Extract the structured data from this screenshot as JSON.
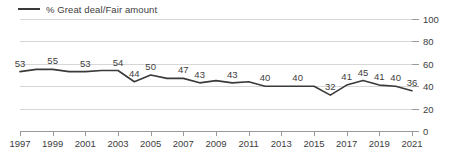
{
  "legend": {
    "label": "% Great deal/Fair amount",
    "line_color": "#3a3a3a",
    "icon": "line-swatch-icon"
  },
  "axes": {
    "y_ticks": [
      0,
      20,
      40,
      60,
      80,
      100
    ],
    "y_min": 0,
    "y_max": 100,
    "x_ticks": [
      1997,
      1999,
      2001,
      2003,
      2005,
      2007,
      2009,
      2011,
      2013,
      2015,
      2017,
      2019,
      2021
    ],
    "x_min": 1997,
    "x_max": 2021,
    "grid": true
  },
  "chart_data": {
    "type": "line",
    "title": "",
    "subtitle": "",
    "xlabel": "",
    "ylabel": "",
    "ylim": [
      0,
      100
    ],
    "xlim": [
      1997,
      2021
    ],
    "grid": true,
    "legend_position": "top-left",
    "categories": [
      1997,
      1998,
      1999,
      2000,
      2001,
      2002,
      2003,
      2004,
      2005,
      2006,
      2007,
      2008,
      2009,
      2010,
      2011,
      2012,
      2013,
      2014,
      2015,
      2016,
      2017,
      2018,
      2019,
      2020,
      2021
    ],
    "series": [
      {
        "name": "% Great deal/Fair amount",
        "color": "#3a3a3a",
        "values": [
          53,
          55,
          55,
          53,
          53,
          54,
          54,
          44,
          50,
          47,
          47,
          43,
          45,
          43,
          44,
          40,
          40,
          40,
          40,
          32,
          41,
          45,
          41,
          40,
          36
        ]
      }
    ],
    "labeled_points": [
      {
        "x": 1997,
        "value": 53
      },
      {
        "x": 1999,
        "value": 55
      },
      {
        "x": 2001,
        "value": 53
      },
      {
        "x": 2003,
        "value": 54
      },
      {
        "x": 2004,
        "value": 44
      },
      {
        "x": 2005,
        "value": 50
      },
      {
        "x": 2007,
        "value": 47
      },
      {
        "x": 2008,
        "value": 43
      },
      {
        "x": 2010,
        "value": 43
      },
      {
        "x": 2012,
        "value": 40
      },
      {
        "x": 2014,
        "value": 40
      },
      {
        "x": 2016,
        "value": 32
      },
      {
        "x": 2017,
        "value": 41
      },
      {
        "x": 2018,
        "value": 45
      },
      {
        "x": 2019,
        "value": 41
      },
      {
        "x": 2020,
        "value": 40
      },
      {
        "x": 2021,
        "value": 36
      }
    ]
  }
}
